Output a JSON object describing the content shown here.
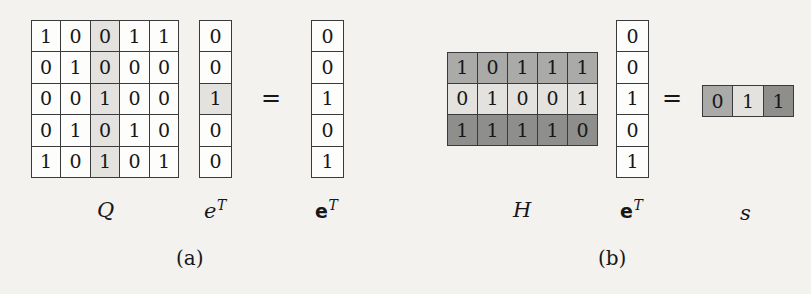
{
  "figure": {
    "background_color": "#f3f2ef",
    "ink_color": "#17171a",
    "shade_colors": {
      "white": "#fdfdfb",
      "light": "#e3e2de",
      "mid": "#aaaaa8",
      "dark": "#8e8e8c"
    },
    "equals_symbol": "=",
    "panels": [
      {
        "id": "a",
        "caption": "(a)",
        "matrix": {
          "name": "Q",
          "label_base": "Q",
          "label_sup": "",
          "rows": 5,
          "cols": 5,
          "values": [
            [
              "1",
              "0",
              "0",
              "1",
              "1"
            ],
            [
              "0",
              "1",
              "0",
              "0",
              "0"
            ],
            [
              "0",
              "0",
              "1",
              "0",
              "0"
            ],
            [
              "0",
              "1",
              "0",
              "1",
              "0"
            ],
            [
              "1",
              "0",
              "1",
              "0",
              "1"
            ]
          ],
          "shades": [
            [
              "white",
              "white",
              "light",
              "white",
              "white"
            ],
            [
              "white",
              "white",
              "light",
              "white",
              "white"
            ],
            [
              "white",
              "white",
              "light",
              "white",
              "white"
            ],
            [
              "white",
              "white",
              "light",
              "white",
              "white"
            ],
            [
              "white",
              "white",
              "light",
              "white",
              "white"
            ]
          ],
          "highlighted_column_index": 2
        },
        "operand": {
          "name": "e-transpose",
          "label_base": "e",
          "label_sup": "T",
          "label_style": "italic",
          "rows": 5,
          "cols": 1,
          "values": [
            [
              "0"
            ],
            [
              "0"
            ],
            [
              "1"
            ],
            [
              "0"
            ],
            [
              "0"
            ]
          ],
          "shades": [
            [
              "white"
            ],
            [
              "white"
            ],
            [
              "light"
            ],
            [
              "white"
            ],
            [
              "white"
            ]
          ],
          "highlighted_row_index": 2
        },
        "result": {
          "name": "e-bold-transpose",
          "label_base": "e",
          "label_sup": "T",
          "label_style": "bold",
          "rows": 5,
          "cols": 1,
          "values": [
            [
              "0"
            ],
            [
              "0"
            ],
            [
              "1"
            ],
            [
              "0"
            ],
            [
              "1"
            ]
          ],
          "shades": [
            [
              "white"
            ],
            [
              "white"
            ],
            [
              "white"
            ],
            [
              "white"
            ],
            [
              "white"
            ]
          ]
        }
      },
      {
        "id": "b",
        "caption": "(b)",
        "matrix": {
          "name": "H",
          "label_base": "H",
          "label_sup": "",
          "rows": 3,
          "cols": 5,
          "values": [
            [
              "1",
              "0",
              "1",
              "1",
              "1"
            ],
            [
              "0",
              "1",
              "0",
              "0",
              "1"
            ],
            [
              "1",
              "1",
              "1",
              "1",
              "0"
            ]
          ],
          "shades": [
            [
              "mid",
              "mid",
              "mid",
              "mid",
              "mid"
            ],
            [
              "light",
              "light",
              "light",
              "light",
              "light"
            ],
            [
              "dark",
              "dark",
              "dark",
              "dark",
              "dark"
            ]
          ]
        },
        "operand": {
          "name": "e-bold-transpose",
          "label_base": "e",
          "label_sup": "T",
          "label_style": "bold",
          "rows": 5,
          "cols": 1,
          "values": [
            [
              "0"
            ],
            [
              "0"
            ],
            [
              "1"
            ],
            [
              "0"
            ],
            [
              "1"
            ]
          ],
          "shades": [
            [
              "white"
            ],
            [
              "white"
            ],
            [
              "white"
            ],
            [
              "white"
            ],
            [
              "white"
            ]
          ]
        },
        "result": {
          "name": "s",
          "label_base": "s",
          "label_sup": "",
          "label_style": "italic",
          "rows": 1,
          "cols": 3,
          "values": [
            [
              "0",
              "1",
              "1"
            ]
          ],
          "shades": [
            [
              "mid",
              "light",
              "dark"
            ]
          ]
        }
      }
    ]
  }
}
